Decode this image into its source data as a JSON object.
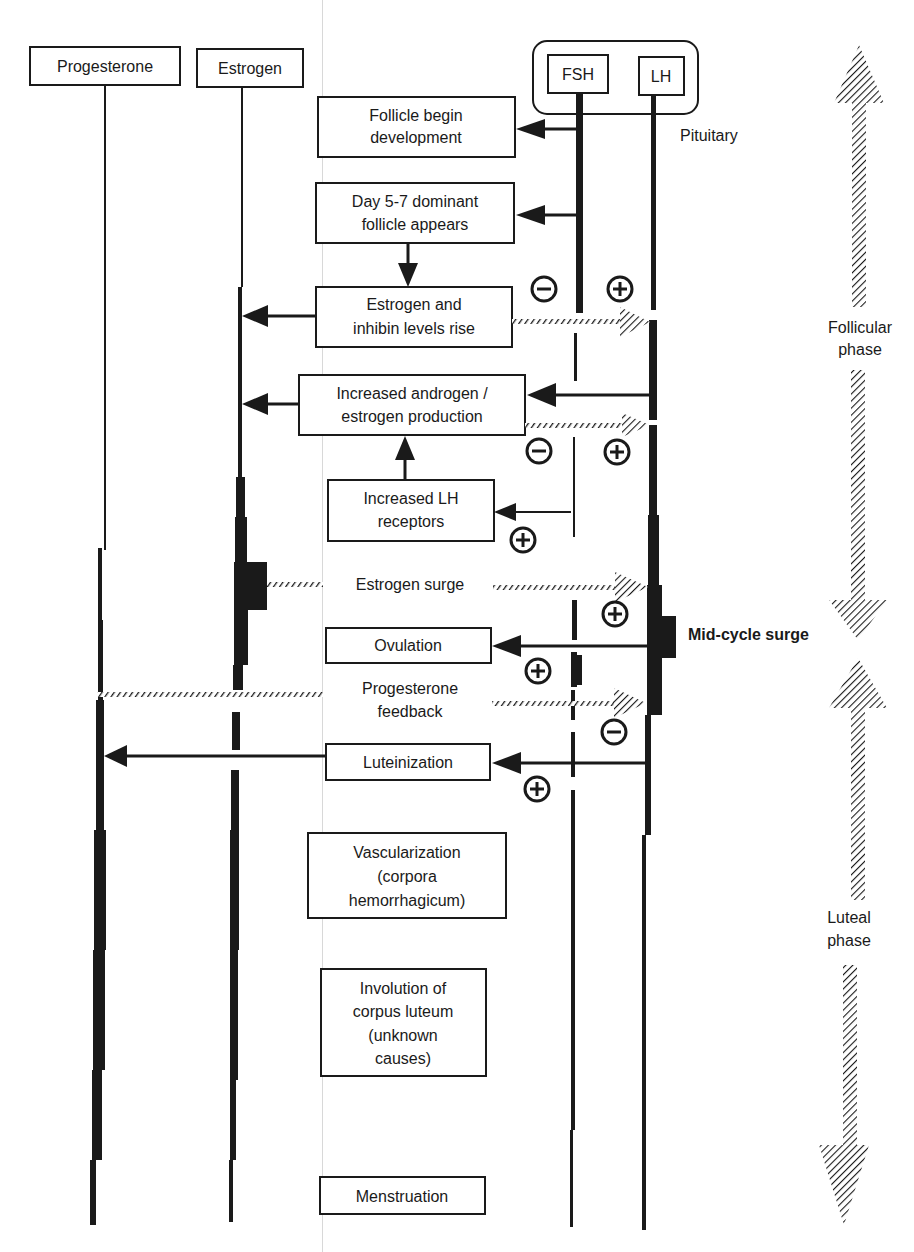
{
  "diagram": {
    "colors": {
      "ink": "#1a1a1a",
      "paper": "#ffffff",
      "fold": "#d8d8d8"
    },
    "hormone_headers": {
      "progesterone": "Progesterone",
      "estrogen": "Estrogen",
      "fsh": "FSH",
      "lh": "LH",
      "pituitary": "Pituitary"
    },
    "events": {
      "follicle_begin": [
        "Follicle begin",
        "development"
      ],
      "dominant_follicle": [
        "Day 5-7 dominant",
        "follicle appears"
      ],
      "estrogen_inhibin": [
        "Estrogen and",
        "inhibin levels rise"
      ],
      "androgen_estrogen": [
        "Increased androgen /",
        "estrogen production"
      ],
      "lh_receptors": [
        "Increased LH",
        "receptors"
      ],
      "estrogen_surge": "Estrogen surge",
      "ovulation": "Ovulation",
      "progesterone_feedback": [
        "Progesterone",
        "feedback"
      ],
      "luteinization": "Luteinization",
      "vascularization": [
        "Vascularization",
        "(corpora",
        "hemorrhagicum)"
      ],
      "involution": [
        "Involution of",
        "corpus luteum",
        "(unknown",
        "causes)"
      ],
      "menstruation": "Menstruation"
    },
    "feedback_signs": {
      "minus": "−",
      "plus": "+"
    },
    "side_labels": {
      "mid_cycle": "Mid-cycle surge",
      "follicular": [
        "Follicular",
        "phase"
      ],
      "luteal": [
        "Luteal",
        "phase"
      ]
    }
  }
}
